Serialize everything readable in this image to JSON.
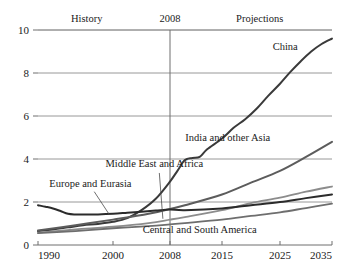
{
  "chart_data": {
    "type": "line",
    "title": "",
    "subtitle": "",
    "xlabel": "",
    "ylabel": "",
    "xlim": [
      1990,
      2035
    ],
    "ylim": [
      0,
      10
    ],
    "grid": true,
    "legend_position": "inline-labels",
    "x_ticks": [
      "1990",
      "2000",
      "2008",
      "2015",
      "2025",
      "2035"
    ],
    "x_tick_values": [
      1990,
      2000,
      2008,
      2015,
      2025,
      2035
    ],
    "y_ticks": [
      "0",
      "2",
      "4",
      "6",
      "8",
      "10"
    ],
    "y_tick_values": [
      0,
      2,
      4,
      6,
      8,
      10
    ],
    "annotations": [
      {
        "name": "history-label",
        "text": "History",
        "x": 1996.5,
        "y": 10.35
      },
      {
        "name": "divider-year-label",
        "text": "2008",
        "x": 2008,
        "y": 10.35
      },
      {
        "name": "projections-label",
        "text": "Projections",
        "x": 2021.5,
        "y": 10.35
      }
    ],
    "divider": {
      "name": "year-2008-divider",
      "x": 2008,
      "label": "2008"
    },
    "series": [
      {
        "name": "China",
        "label": "China",
        "color": "#3a3a3a",
        "width": 2.0,
        "label_x": 2026.0,
        "label_y": 9.05,
        "x": [
          1990,
          1992,
          1994,
          1996,
          1998,
          2000,
          2002,
          2004,
          2006,
          2008,
          2009,
          2010,
          2011,
          2012,
          2013,
          2015,
          2017,
          2019,
          2021,
          2023,
          2025,
          2027,
          2029,
          2031,
          2033,
          2035
        ],
        "values": [
          0.65,
          0.72,
          0.82,
          0.92,
          0.98,
          1.08,
          1.25,
          1.62,
          2.15,
          2.95,
          3.45,
          3.95,
          4.05,
          4.1,
          4.45,
          4.95,
          5.45,
          5.85,
          6.35,
          6.95,
          7.5,
          8.05,
          8.55,
          9.0,
          9.35,
          9.6
        ]
      },
      {
        "name": "India and other Asia",
        "label": "India and other Asia",
        "color": "#5c5c5c",
        "width": 2.0,
        "label_x": 2016.0,
        "label_y": 4.85,
        "x": [
          1990,
          1995,
          2000,
          2005,
          2008,
          2010,
          2015,
          2020,
          2025,
          2030,
          2035
        ],
        "values": [
          0.68,
          0.92,
          1.18,
          1.45,
          1.68,
          1.85,
          2.35,
          2.9,
          3.45,
          4.1,
          4.8
        ]
      },
      {
        "name": "Middle East and Africa",
        "label": "Middle East and Africa",
        "color": "#8c8c8c",
        "width": 1.8,
        "label_x": 1999.0,
        "label_y": 3.62,
        "leader": {
          "from_x": 2006.5,
          "from_y": 3.35,
          "to_x": 2007.0,
          "to_y": 1.22
        },
        "x": [
          1990,
          1995,
          2000,
          2005,
          2008,
          2010,
          2015,
          2020,
          2025,
          2030,
          2035
        ],
        "values": [
          0.58,
          0.72,
          0.85,
          1.02,
          1.18,
          1.3,
          1.62,
          1.95,
          2.2,
          2.48,
          2.72
        ]
      },
      {
        "name": "Europe and Eurasia",
        "label": "Europe and Eurasia",
        "color": "#2b2b2b",
        "width": 2.0,
        "label_x": 1991.5,
        "label_y": 2.72,
        "leader": {
          "from_x": 1997.5,
          "from_y": 2.48,
          "to_x": 1999.5,
          "to_y": 1.42
        },
        "x": [
          1990,
          1991,
          1992,
          1993,
          1994,
          1995,
          1996,
          1997,
          1998,
          2000,
          2002,
          2004,
          2006,
          2008,
          2010,
          2015,
          2020,
          2025,
          2030,
          2035
        ],
        "values": [
          1.85,
          1.78,
          1.7,
          1.58,
          1.45,
          1.42,
          1.42,
          1.42,
          1.42,
          1.45,
          1.5,
          1.55,
          1.6,
          1.65,
          1.62,
          1.7,
          1.85,
          2.0,
          2.18,
          2.35
        ]
      },
      {
        "name": "Central and South America",
        "label": "Central and South America",
        "color": "#6e6e6e",
        "width": 1.8,
        "label_x": 2012.0,
        "label_y": 0.55,
        "x": [
          1990,
          1995,
          2000,
          2005,
          2008,
          2010,
          2015,
          2020,
          2025,
          2030,
          2035
        ],
        "values": [
          0.55,
          0.65,
          0.78,
          0.88,
          0.96,
          1.02,
          1.18,
          1.35,
          1.52,
          1.72,
          1.92
        ]
      }
    ]
  }
}
